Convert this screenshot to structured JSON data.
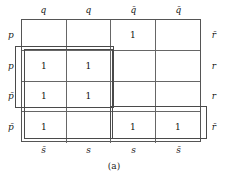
{
  "figure": {
    "caption": "(a)",
    "type": "karnaugh-map"
  },
  "kmap": {
    "column_headers_top": [
      "q",
      "q",
      "q̄",
      "q̄"
    ],
    "column_headers_top_plain": [
      "q",
      "q",
      "q-bar",
      "q-bar"
    ],
    "column_labels_bottom": [
      "s̄",
      "s",
      "s",
      "s̄"
    ],
    "column_labels_bottom_plain": [
      "s-bar",
      "s",
      "s",
      "s-bar"
    ],
    "row_labels_left": [
      "p",
      "p",
      "p̄",
      "p̄"
    ],
    "row_labels_left_plain": [
      "p",
      "p",
      "p-bar",
      "p-bar"
    ],
    "row_labels_right": [
      "r̄",
      "r",
      "r",
      "r̄"
    ],
    "row_labels_right_plain": [
      "r-bar",
      "r",
      "r",
      "r-bar"
    ],
    "cells": [
      [
        "",
        "",
        "1",
        ""
      ],
      [
        "1",
        "1",
        "",
        ""
      ],
      [
        "1",
        "1",
        "",
        ""
      ],
      [
        "1",
        "",
        "1",
        "1"
      ]
    ],
    "groups": [
      {
        "name": "group-left-2x2",
        "rows": [
          2,
          3
        ],
        "cols": [
          1,
          2
        ]
      },
      {
        "name": "group-left-column-tall",
        "rows": [
          2,
          3,
          4
        ],
        "cols": [
          1,
          2
        ]
      },
      {
        "name": "group-bottom-right-pair",
        "rows": [
          4
        ],
        "cols": [
          3,
          4
        ]
      }
    ],
    "grid_color": "#666666",
    "group_color": "#4a4a4a"
  }
}
